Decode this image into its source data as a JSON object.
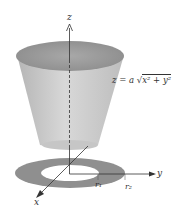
{
  "figure": {
    "equation": {
      "lhs": "z",
      "equals": "=",
      "coef": "a",
      "radicand": "x² + y²",
      "full": "z = a √(x² + y²)"
    },
    "axes": {
      "z": "z",
      "y": "y",
      "x": "x"
    },
    "radii": {
      "inner": "r₁",
      "outer": "r₂"
    },
    "colors": {
      "cone_side": "#c8c8c8",
      "cone_top": "#9a9a9a",
      "annulus": "#8f8f8f",
      "axis": "#333333"
    }
  }
}
